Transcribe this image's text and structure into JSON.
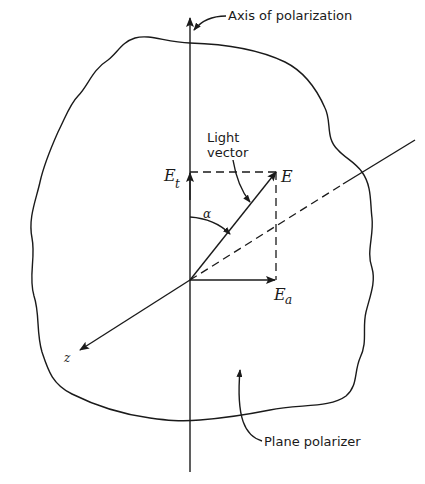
{
  "diagram": {
    "type": "polarization-diagram",
    "labels": {
      "axis": "Axis of polarization",
      "light_vector_line1": "Light",
      "light_vector_line2": "vector",
      "E": "E",
      "Et_main": "E",
      "Et_sub": "t",
      "Ea_main": "E",
      "Ea_sub": "a",
      "alpha": "α",
      "z": "z",
      "plane_polarizer": "Plane polarizer"
    },
    "colors": {
      "ink": "#1a1a1a",
      "background": "#ffffff"
    },
    "geometry": {
      "origin": [
        190,
        280
      ],
      "E_tip": [
        276,
        172
      ],
      "Et_tip": [
        190,
        172
      ],
      "Ea_tip": [
        276,
        280
      ],
      "z_tip": [
        80,
        350
      ]
    }
  }
}
